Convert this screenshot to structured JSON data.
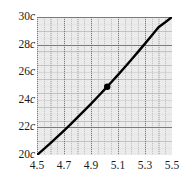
{
  "chart_data": {
    "type": "line",
    "title": "",
    "subtitle": "",
    "xlabel": "",
    "ylabel": "",
    "xlim": [
      4.5,
      5.5
    ],
    "ylim": [
      20,
      30
    ],
    "grid": true,
    "grid_style": "dotted",
    "legend": "none",
    "background_color": "#ebebeb",
    "line_color": "#000000",
    "marker_color": "#000000",
    "x_ticks": [
      4.5,
      4.7,
      4.9,
      5.1,
      5.3,
      5.5
    ],
    "x_tick_labels": [
      "4.5",
      "4.7",
      "4.9",
      "5.1",
      "5.3",
      "5.5"
    ],
    "y_ticks": [
      20,
      22,
      24,
      26,
      28,
      30
    ],
    "y_tick_labels": [
      "20c",
      "22c",
      "24c",
      "26c",
      "28c",
      "30c"
    ],
    "y_tick_unit": "c",
    "y_tick_unit_italic": true,
    "x_minor_step": 0.05,
    "y_minor_step": 0.5,
    "series": [
      {
        "name": "curve",
        "x": [
          4.5,
          4.55,
          4.6,
          4.65,
          4.7,
          4.75,
          4.8,
          4.85,
          4.9,
          4.95,
          5.0,
          5.05,
          5.1,
          5.15,
          5.2,
          5.25,
          5.3,
          5.35,
          5.4,
          5.45,
          5.5
        ],
        "y": [
          20.0,
          20.42,
          20.86,
          21.31,
          21.77,
          22.24,
          22.72,
          23.21,
          23.71,
          24.22,
          24.74,
          25.27,
          25.81,
          26.36,
          26.92,
          27.49,
          28.07,
          28.66,
          29.26,
          29.62,
          30.0
        ]
      }
    ],
    "markers": [
      {
        "name": "highlighted-point",
        "x": 5.02,
        "y": 24.95,
        "radius": 3.2
      }
    ]
  },
  "axes": {
    "y_labels": [
      {
        "value": 30,
        "number": "30",
        "unit": "c"
      },
      {
        "value": 28,
        "number": "28",
        "unit": "c"
      },
      {
        "value": 26,
        "number": "26",
        "unit": "c"
      },
      {
        "value": 24,
        "number": "24",
        "unit": "c"
      },
      {
        "value": 22,
        "number": "22",
        "unit": "c"
      },
      {
        "value": 20,
        "number": "20",
        "unit": "c"
      }
    ],
    "x_labels": [
      {
        "value": 4.5,
        "text": "4.5"
      },
      {
        "value": 4.7,
        "text": "4.7"
      },
      {
        "value": 4.9,
        "text": "4.9"
      },
      {
        "value": 5.1,
        "text": "5.1"
      },
      {
        "value": 5.3,
        "text": "5.3"
      },
      {
        "value": 5.5,
        "text": "5.5"
      }
    ]
  }
}
